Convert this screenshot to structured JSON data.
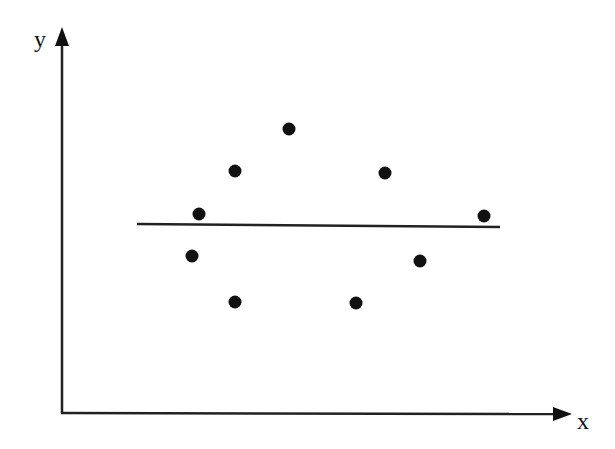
{
  "chart_data": {
    "type": "scatter",
    "title": "",
    "xlabel": "x",
    "ylabel": "y",
    "grid": false,
    "legend": null,
    "ticks": false,
    "axis_range_px": {
      "origin": [
        61,
        413
      ],
      "x_end": 570,
      "y_end": 30
    },
    "points": [
      {
        "x": 192,
        "y": 256
      },
      {
        "x": 199,
        "y": 214
      },
      {
        "x": 235,
        "y": 171
      },
      {
        "x": 235,
        "y": 302
      },
      {
        "x": 289,
        "y": 129
      },
      {
        "x": 356,
        "y": 303
      },
      {
        "x": 385,
        "y": 173
      },
      {
        "x": 420,
        "y": 261
      },
      {
        "x": 484,
        "y": 216
      }
    ],
    "fit_line": {
      "x1": 137,
      "y1": 224,
      "x2": 500,
      "y2": 227,
      "description": "horizontal line through mean of y"
    },
    "colors": {
      "points": "#111111",
      "axes": "#222222",
      "line": "#222222"
    }
  }
}
